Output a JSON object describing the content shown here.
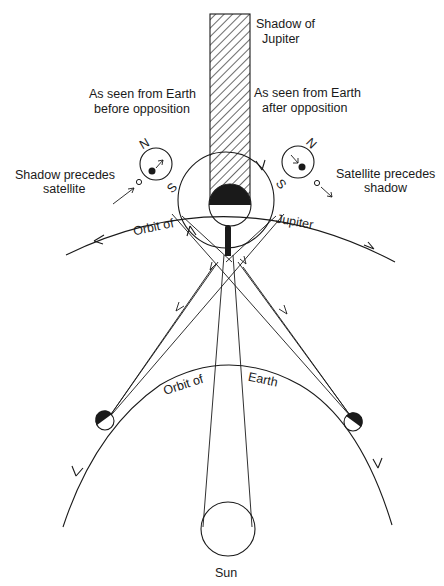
{
  "diagram": {
    "type": "astronomy-geometry",
    "labels": {
      "shadow_line1": "Shadow of",
      "shadow_line2": "Jupiter",
      "before_line1": "As seen from Earth",
      "before_line2": "before opposition",
      "after_line1": "As seen from Earth",
      "after_line2": "after opposition",
      "left_note_line1": "Shadow precedes",
      "left_note_line2": "satellite",
      "right_note_line1": "Satellite precedes",
      "right_note_line2": "shadow",
      "jupiter_orbit_a": "Orbit of",
      "jupiter_orbit_b": "Jupiter",
      "earth_orbit_a": "Orbit of",
      "earth_orbit_b": "Earth",
      "sun": "Sun",
      "north_left": "N",
      "south_left": "S",
      "north_right": "N",
      "south_right": "S"
    },
    "colors": {
      "ink": "#1a1a1a",
      "background": "#ffffff"
    }
  }
}
